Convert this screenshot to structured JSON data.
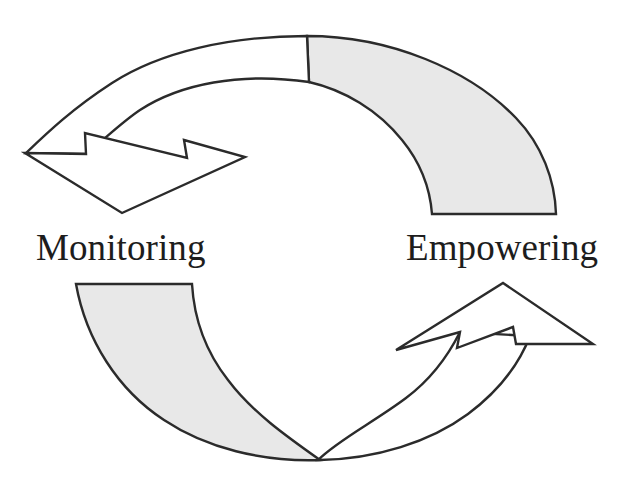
{
  "diagram": {
    "name": "two-stage-cycle-diagram",
    "type": "circular-cycle",
    "background_color": "#ffffff",
    "outline_color": "#2b2b2b",
    "fill_white": "#ffffff",
    "fill_gray": "#e8e8e8",
    "labels": [
      {
        "id": "monitoring",
        "text": "Monitoring",
        "position": "left-middle"
      },
      {
        "id": "empowering",
        "text": "Empowering",
        "position": "right-middle"
      }
    ],
    "arrows": [
      {
        "id": "top-arrow",
        "direction": "clockwise-to-counterclockwise",
        "head_position": "left",
        "head_points_down": true,
        "tail_position": "right",
        "head_fill": "#ffffff",
        "tail_fill": "#e8e8e8"
      },
      {
        "id": "bottom-arrow",
        "direction": "left-to-right",
        "head_position": "right",
        "head_points_up": true,
        "tail_position": "left",
        "head_fill": "#ffffff",
        "tail_fill": "#e8e8e8"
      }
    ]
  }
}
